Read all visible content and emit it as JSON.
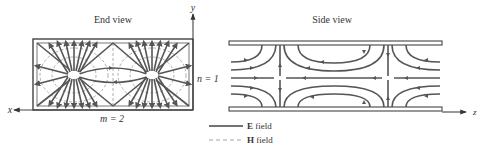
{
  "figure": {
    "end_view": {
      "title": "End view",
      "x_axis_label": "x",
      "y_axis_label": "y",
      "m_label": "m = 2",
      "n_label": "n = 1"
    },
    "side_view": {
      "title": "Side view",
      "z_axis_label": "z"
    },
    "legend": {
      "items": [
        {
          "label_bold": "E",
          "label_rest": " field",
          "style": "solid"
        },
        {
          "label_bold": "H",
          "label_rest": " field",
          "style": "dashed"
        }
      ]
    },
    "colors": {
      "field_line": "#555555",
      "h_field_line": "#9a9a9a",
      "background": "#ffffff"
    }
  }
}
